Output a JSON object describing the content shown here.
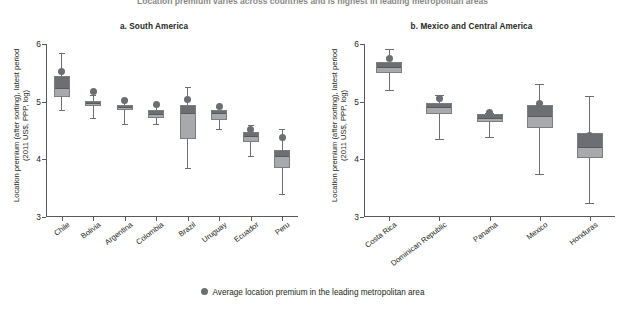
{
  "figure": {
    "suptitle": "Location premium varies across countries and is highest in leading metropolitan areas"
  },
  "legend": {
    "label": "Average location premium in the leading metropolitan area",
    "marker_color": "#6d6e71"
  },
  "colors": {
    "box_lower": "#a7a9ac",
    "box_upper": "#6d6e71",
    "whisker": "#6d6e71",
    "axis": "#58595b",
    "text": "#231f20"
  },
  "chart_data": [
    {
      "type": "box",
      "panel": "a",
      "title": "a. South America",
      "ylabel": "Location premium (after sorting), latest period (2011 US$, PPP, log)",
      "ylabel_line1": "Location premium (after sorting), latest period",
      "ylabel_line2": "(2011 US$, PPP, log)",
      "xlabel": "",
      "ylim": [
        3,
        6
      ],
      "yticks": [
        3,
        4,
        5,
        6
      ],
      "grid": false,
      "legend_position": "bottom-center",
      "categories": [
        "Chile",
        "Bolivia",
        "Argentina",
        "Colombia",
        "Brazil",
        "Uruguay",
        "Ecuador",
        "Peru"
      ],
      "boxes": [
        {
          "category": "Chile",
          "whisker_low": 4.85,
          "q1": 5.08,
          "median": 5.23,
          "q3": 5.45,
          "whisker_high": 5.85,
          "dot": 5.52
        },
        {
          "category": "Bolivia",
          "whisker_low": 4.72,
          "q1": 4.92,
          "median": 4.97,
          "q3": 5.02,
          "whisker_high": 5.12,
          "dot": 5.18
        },
        {
          "category": "Argentina",
          "whisker_low": 4.62,
          "q1": 4.85,
          "median": 4.9,
          "q3": 4.95,
          "whisker_high": 5.05,
          "dot": 5.02
        },
        {
          "category": "Colombia",
          "whisker_low": 4.62,
          "q1": 4.72,
          "median": 4.79,
          "q3": 4.86,
          "whisker_high": 4.95,
          "dot": 4.95
        },
        {
          "category": "Brazil",
          "whisker_low": 3.85,
          "q1": 4.35,
          "median": 4.8,
          "q3": 4.95,
          "whisker_high": 5.25,
          "dot": 5.03
        },
        {
          "category": "Uruguay",
          "whisker_low": 4.52,
          "q1": 4.68,
          "median": 4.8,
          "q3": 4.86,
          "whisker_high": 4.9,
          "dot": 4.92
        },
        {
          "category": "Ecuador",
          "whisker_low": 4.05,
          "q1": 4.3,
          "median": 4.41,
          "q3": 4.47,
          "whisker_high": 4.6,
          "dot": 4.52
        },
        {
          "category": "Peru",
          "whisker_low": 3.4,
          "q1": 3.85,
          "median": 4.06,
          "q3": 4.16,
          "whisker_high": 4.52,
          "dot": 4.38
        }
      ]
    },
    {
      "type": "box",
      "panel": "b",
      "title": "b. Mexico and Central America",
      "ylabel": "Location premium (after sorting), latest period (2011 US$, PPP, log)",
      "ylabel_line1": "Location premium (after sorting), latest period",
      "ylabel_line2": "(2011 US$, PPP, log)",
      "xlabel": "",
      "ylim": [
        3,
        6
      ],
      "yticks": [
        3,
        4,
        5,
        6
      ],
      "grid": false,
      "legend_position": "bottom-center",
      "categories": [
        "Costa Rica",
        "Dominican Republic",
        "Panama",
        "Mexico",
        "Honduras"
      ],
      "boxes": [
        {
          "category": "Costa Rica",
          "whisker_low": 5.2,
          "q1": 5.5,
          "median": 5.6,
          "q3": 5.68,
          "whisker_high": 5.92,
          "dot": 5.74
        },
        {
          "category": "Dominican Republic",
          "whisker_low": 4.35,
          "q1": 4.78,
          "median": 4.9,
          "q3": 4.97,
          "whisker_high": 5.12,
          "dot": 5.06
        },
        {
          "category": "Panama",
          "whisker_low": 4.38,
          "q1": 4.64,
          "median": 4.72,
          "q3": 4.78,
          "whisker_high": 4.8,
          "dot": 4.81
        },
        {
          "category": "Mexico",
          "whisker_low": 3.75,
          "q1": 4.55,
          "median": 4.76,
          "q3": 4.95,
          "whisker_high": 5.3,
          "dot": 4.97
        },
        {
          "category": "Honduras",
          "whisker_low": 3.25,
          "q1": 4.02,
          "median": 4.22,
          "q3": 4.45,
          "whisker_high": 5.1,
          "dot": 4.42
        }
      ]
    }
  ]
}
